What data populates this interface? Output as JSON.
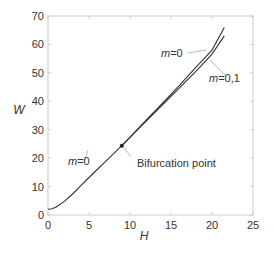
{
  "chart_data": {
    "type": "line",
    "title": "",
    "xlabel": "H",
    "ylabel": "W",
    "xlim": [
      0,
      25
    ],
    "ylim": [
      0,
      70
    ],
    "xticks": [
      0,
      5,
      10,
      15,
      20,
      25
    ],
    "yticks": [
      0,
      10,
      20,
      30,
      40,
      50,
      60,
      70
    ],
    "grid": false,
    "legend": "none (inline annotations)",
    "series": [
      {
        "name": "m=0",
        "x": [
          0,
          0.5,
          1,
          2,
          3,
          4,
          5,
          6,
          7,
          8,
          9,
          10,
          12,
          14,
          16,
          18,
          20,
          21.5
        ],
        "values": [
          2,
          2.2,
          2.8,
          4.8,
          7.4,
          10.3,
          13.2,
          16.0,
          18.8,
          21.6,
          24.4,
          27.4,
          33.4,
          39.4,
          45.5,
          51.8,
          58.0,
          66
        ]
      },
      {
        "name": "m=0,1",
        "x": [
          9,
          10,
          12,
          14,
          16,
          18,
          20,
          21.5
        ],
        "values": [
          24.4,
          27.3,
          33.1,
          38.8,
          44.6,
          50.4,
          56.6,
          63
        ]
      }
    ],
    "annotations": [
      {
        "text": "m=0",
        "x": 4.5,
        "y": 19,
        "points_to": "lower branch"
      },
      {
        "text": "m=0",
        "x": 15,
        "y": 60,
        "points_to": "upper branch"
      },
      {
        "text": "m=0,1",
        "x": 20.5,
        "y": 49,
        "points_to": "lower upper-branch"
      },
      {
        "text": "Bifurcation point",
        "x": 9,
        "y": 24.4,
        "marker": "dot"
      }
    ]
  },
  "labels": {
    "xlabel": "H",
    "ylabel": "W",
    "bifurcation": "Bifurcation point",
    "m_var": "m",
    "eq": "=",
    "m0_val": "0",
    "m01_val": "0,1"
  }
}
